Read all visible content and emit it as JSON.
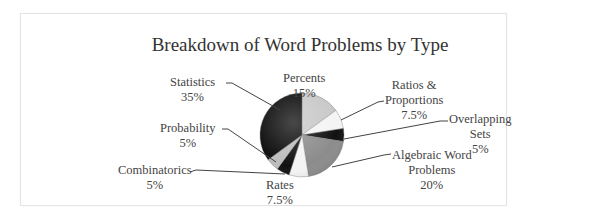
{
  "chart_data": {
    "type": "pie",
    "title": "Breakdown of Word Problems by Type",
    "start_angle": "12 o'clock, clockwise",
    "slices": [
      {
        "label": "Percents",
        "value": 15,
        "display": "15%",
        "color": "#c8c8c8"
      },
      {
        "label": "Ratios & Proportions",
        "value": 7.5,
        "display": "7.5%",
        "color": "#f4f4f4"
      },
      {
        "label": "Overlapping Sets",
        "value": 5,
        "display": "5%",
        "color": "#111111"
      },
      {
        "label": "Algebraic Word Problems",
        "value": 20,
        "display": "20%",
        "color": "#8c8c8c"
      },
      {
        "label": "Rates",
        "value": 7.5,
        "display": "7.5%",
        "color": "#f4f4f4"
      },
      {
        "label": "Combinatorics",
        "value": 5,
        "display": "5%",
        "color": "#111111"
      },
      {
        "label": "Probability",
        "value": 5,
        "display": "5%",
        "color": "#bdbdbd"
      },
      {
        "label": "Statistics",
        "value": 35,
        "display": "35%",
        "color": "#0c0c0c"
      }
    ],
    "legend": "none (leader-line labels)"
  },
  "labels": {
    "percents": {
      "name": "Percents",
      "pct": "15%"
    },
    "ratios": {
      "line1": "Ratios &",
      "line2": "Proportions",
      "pct": "7.5%"
    },
    "overlapping": {
      "line1": "Overlapping",
      "line2": "Sets",
      "pct": "5%"
    },
    "algebraic": {
      "line1": "Algebraic Word",
      "line2": "Problems",
      "pct": "20%"
    },
    "rates": {
      "name": "Rates",
      "pct": "7.5%"
    },
    "combinatorics": {
      "name": "Combinatorics",
      "pct": "5%"
    },
    "probability": {
      "name": "Probability",
      "pct": "5%"
    },
    "statistics": {
      "name": "Statistics",
      "pct": "35%"
    }
  }
}
